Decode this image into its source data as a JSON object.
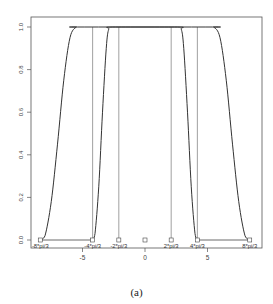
{
  "chart_data": {
    "type": "line",
    "title": "",
    "caption": "(a)",
    "xlabel": "",
    "ylabel": "",
    "xlim": [
      -8.8,
      9.4
    ],
    "ylim": [
      -0.04,
      1.04
    ],
    "grid": false,
    "legend": null,
    "x_ticks": [
      -5,
      0,
      5
    ],
    "x_tick_labels": [
      "-5",
      "0",
      "5"
    ],
    "y_ticks": [
      0.0,
      0.2,
      0.4,
      0.6,
      0.8,
      1.0
    ],
    "y_tick_labels": [
      "0.0",
      "0.2",
      "0.4",
      "0.6",
      "0.8",
      "1.0"
    ],
    "annotations": [
      {
        "text": "-8*pi/3",
        "x": -8.378,
        "y": 0
      },
      {
        "text": "-4*pi/3",
        "x": -4.189,
        "y": 0
      },
      {
        "text": "-2*pi/3",
        "x": -2.094,
        "y": 0
      },
      {
        "text": "2*pi/3",
        "x": 2.094,
        "y": 0
      },
      {
        "text": "4*pi/3",
        "x": 4.189,
        "y": 0
      },
      {
        "text": "8*pi/3",
        "x": 8.378,
        "y": 0
      }
    ],
    "markers": [
      {
        "x": -8.378,
        "y": 0
      },
      {
        "x": -4.189,
        "y": 0
      },
      {
        "x": -2.094,
        "y": 0
      },
      {
        "x": 0,
        "y": 0
      },
      {
        "x": 2.094,
        "y": 0
      },
      {
        "x": 4.189,
        "y": 0
      },
      {
        "x": 8.378,
        "y": 0
      }
    ],
    "vertical_lines": [
      -4.189,
      -2.094,
      2.094,
      4.189
    ],
    "horizontal_segments": [
      {
        "x0": -8.378,
        "x1": -4.189,
        "y": 0
      },
      {
        "x0": 4.189,
        "x1": 8.378,
        "y": 0
      }
    ],
    "series": [
      {
        "name": "outer window",
        "x": [
          -8.378,
          -8.0,
          -7.5,
          -7.0,
          -6.5,
          -6.0,
          -5.5,
          -5.2,
          5.2,
          5.5,
          6.0,
          6.5,
          7.0,
          7.5,
          8.0,
          8.378
        ],
        "y": [
          0.0,
          0.02,
          0.18,
          0.45,
          0.75,
          0.95,
          1.0,
          1.0,
          1.0,
          1.0,
          0.95,
          0.75,
          0.45,
          0.18,
          0.02,
          0.0
        ]
      },
      {
        "name": "inner window",
        "x": [
          -4.189,
          -4.0,
          -3.7,
          -3.4,
          -3.1,
          -2.9,
          -2.6,
          2.6,
          2.9,
          3.1,
          3.4,
          3.7,
          4.0,
          4.189
        ],
        "y": [
          0.0,
          0.03,
          0.25,
          0.6,
          0.9,
          0.99,
          1.0,
          1.0,
          0.99,
          0.9,
          0.6,
          0.25,
          0.03,
          0.0
        ]
      }
    ]
  }
}
